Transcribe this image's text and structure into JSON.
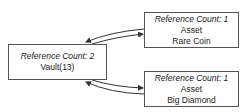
{
  "nodes": {
    "vault": {
      "ref_count_label": "Reference Count: 2",
      "line1": "Vault(13)"
    },
    "rare_coin": {
      "ref_count_label": "Reference Count: 1",
      "line1": "Asset",
      "line2": "Rare Coin"
    },
    "big_diamond": {
      "ref_count_label": "Reference Count: 1",
      "line1": "Asset",
      "line2": "Big Diamond"
    }
  },
  "edges": [
    {
      "from": "vault",
      "to": "rare_coin",
      "bidirectional": true
    },
    {
      "from": "vault",
      "to": "big_diamond",
      "bidirectional": true
    }
  ],
  "colors": {
    "border": "#555555",
    "arrow": "#333333",
    "text": "#1a1a1a"
  }
}
